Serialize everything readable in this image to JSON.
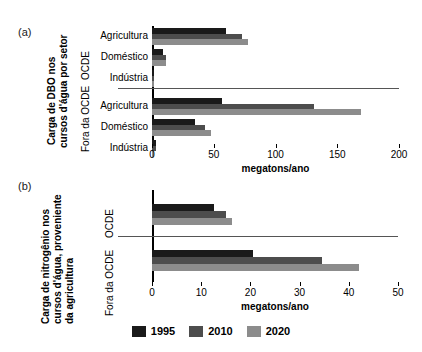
{
  "panels": {
    "a": {
      "letter": "(a)",
      "title_lines": [
        "Carga de DBO nos",
        "cursos d'água por setor"
      ],
      "groups": [
        "OCDE",
        "Fora da OCDE"
      ],
      "xlabel": "megatons/ano"
    },
    "b": {
      "letter": "(b)",
      "title_lines": [
        "Carga de nitrogênio nos",
        "cursos d'água, proveniente",
        "da agricultura"
      ],
      "groups": [
        "OCDE",
        "Fora da OCDE"
      ],
      "xlabel": "megatons/ano"
    }
  },
  "legend": {
    "items": [
      {
        "label": "1995",
        "color": "#1a1a1a"
      },
      {
        "label": "2010",
        "color": "#4d4d4d"
      },
      {
        "label": "2020",
        "color": "#8c8c8c"
      }
    ]
  },
  "chart_data": [
    {
      "type": "bar",
      "orientation": "horizontal",
      "panel": "a",
      "title": "Carga de DBO nos cursos d'água por setor",
      "xlabel": "megatons/ano",
      "ylabel": "",
      "xlim": [
        0,
        200
      ],
      "xticks": [
        0,
        50,
        100,
        150,
        200
      ],
      "grid": false,
      "legend_position": "bottom",
      "groups": [
        {
          "name": "OCDE",
          "categories": [
            "Agricultura",
            "Doméstico",
            "Indústria"
          ],
          "series": [
            {
              "name": "1995",
              "color": "#1a1a1a",
              "values": [
                60,
                9,
                2
              ]
            },
            {
              "name": "2010",
              "color": "#4d4d4d",
              "values": [
                73,
                11,
                2
              ]
            },
            {
              "name": "2020",
              "color": "#8c8c8c",
              "values": [
                78,
                11,
                1
              ]
            }
          ]
        },
        {
          "name": "Fora da OCDE",
          "categories": [
            "Agricultura",
            "Doméstico",
            "Indústria"
          ],
          "series": [
            {
              "name": "1995",
              "color": "#1a1a1a",
              "values": [
                57,
                35,
                3
              ]
            },
            {
              "name": "2010",
              "color": "#4d4d4d",
              "values": [
                131,
                43,
                3
              ]
            },
            {
              "name": "2020",
              "color": "#8c8c8c",
              "values": [
                169,
                48,
                2
              ]
            }
          ]
        }
      ]
    },
    {
      "type": "bar",
      "orientation": "horizontal",
      "panel": "b",
      "title": "Carga de nitrogênio nos cursos d'água, proveniente da agricultura",
      "xlabel": "megatons/ano",
      "ylabel": "",
      "xlim": [
        0,
        50
      ],
      "xticks": [
        0,
        10,
        20,
        30,
        40,
        50
      ],
      "grid": false,
      "legend_position": "bottom",
      "groups": [
        {
          "name": "OCDE",
          "categories": [
            ""
          ],
          "series": [
            {
              "name": "1995",
              "color": "#1a1a1a",
              "values": [
                12.5
              ]
            },
            {
              "name": "2010",
              "color": "#4d4d4d",
              "values": [
                15.0
              ]
            },
            {
              "name": "2020",
              "color": "#8c8c8c",
              "values": [
                16.2
              ]
            }
          ]
        },
        {
          "name": "Fora da OCDE",
          "categories": [
            ""
          ],
          "series": [
            {
              "name": "1995",
              "color": "#1a1a1a",
              "values": [
                20.5
              ]
            },
            {
              "name": "2010",
              "color": "#4d4d4d",
              "values": [
                34.5
              ]
            },
            {
              "name": "2020",
              "color": "#8c8c8c",
              "values": [
                42.0
              ]
            }
          ]
        }
      ]
    }
  ]
}
